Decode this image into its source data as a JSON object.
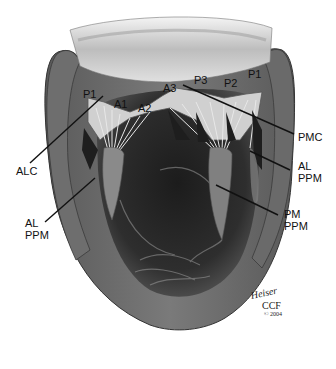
{
  "figure": {
    "type": "anatomical illustration",
    "colors": {
      "background": "#ffffff",
      "tissue_dark": "#2b2b2b",
      "tissue_mid": "#6a6a6a",
      "tissue_light": "#c9c9c9",
      "label_text": "#111111"
    }
  },
  "labels": {
    "p1_left": "P1",
    "a1": "A1",
    "a2": "A2",
    "a3": "A3",
    "p3": "P3",
    "p2": "P2",
    "p1_right": "P1",
    "pmc": "PMC",
    "al_ppm_right_line1": "AL",
    "al_ppm_right_line2": "PPM",
    "pm_ppm_line1": "PM",
    "pm_ppm_line2": "PPM",
    "alc": "ALC",
    "al_ppm_left_line1": "AL",
    "al_ppm_left_line2": "PPM"
  },
  "signature": {
    "script": "Heiser",
    "org": "CCF",
    "year": "© 2004"
  }
}
